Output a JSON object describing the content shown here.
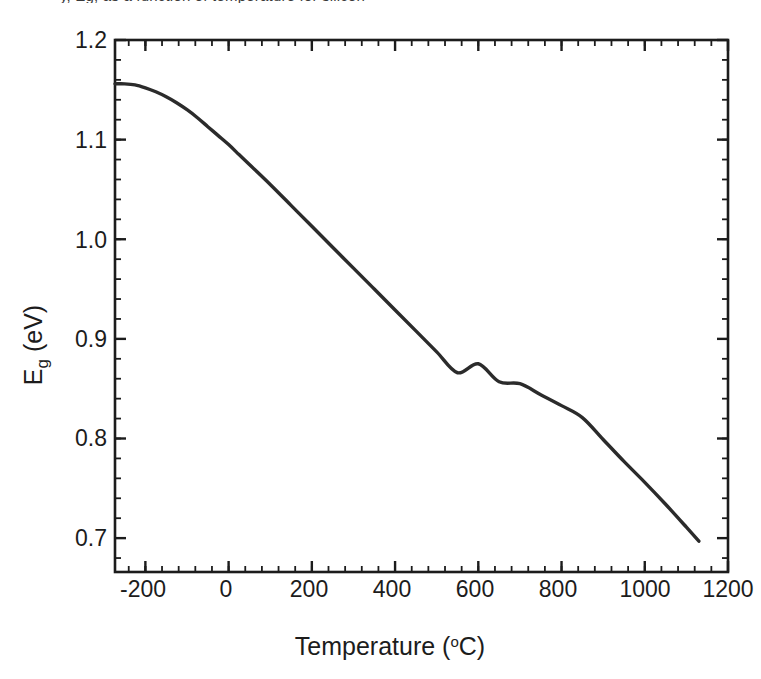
{
  "figure": {
    "caption_fragment": "y, Eg, as a function of temperature for silicon",
    "background_color": "#ffffff",
    "frame_color": "#1c1c1c",
    "curve_color": "#2b2b2b"
  },
  "chart_data": {
    "type": "line",
    "title": "",
    "xlabel": "Temperature (°C)",
    "xlabel_text": "Temperature (",
    "xlabel_unit_sup": "o",
    "xlabel_unit_rest": "C)",
    "ylabel": "Eg (eV)",
    "ylabel_main": "E",
    "ylabel_sub": "g",
    "ylabel_rest": " (eV)",
    "xlim": [
      -273,
      1200
    ],
    "ylim": [
      0.666,
      1.2
    ],
    "xticks": [
      -200,
      0,
      200,
      400,
      600,
      800,
      1000,
      1200
    ],
    "xtick_labels": [
      "-200",
      "0",
      "200",
      "400",
      "600",
      "800",
      "1000",
      "1200"
    ],
    "yticks": [
      0.7,
      0.8,
      0.9,
      1.0,
      1.1,
      1.2
    ],
    "ytick_labels": [
      "0.7",
      "0.8",
      "0.9",
      "1.0",
      "1.1",
      "1.2"
    ],
    "x_minor_per_major": 4,
    "y_minor_per_major": 4,
    "grid": false,
    "legend": null,
    "ticks_direction": "in",
    "series": [
      {
        "name": "Silicon bandgap (Varshni)",
        "x": [
          -273,
          -250,
          -225,
          -200,
          -175,
          -150,
          -125,
          -100,
          -75,
          -50,
          -25,
          0,
          25,
          50,
          100,
          150,
          200,
          250,
          300,
          350,
          400,
          450,
          500,
          550,
          600,
          650,
          700,
          750,
          800,
          850,
          900,
          950,
          1000,
          1050,
          1100,
          1130
        ],
        "y": [
          1.156,
          1.156,
          1.155,
          1.152,
          1.148,
          1.143,
          1.137,
          1.13,
          1.122,
          1.113,
          1.104,
          1.095,
          1.085,
          1.075,
          1.055,
          1.034,
          1.013,
          0.992,
          0.971,
          0.95,
          0.929,
          0.908,
          0.887,
          0.866,
          0.875,
          0.857,
          0.855,
          0.844,
          0.833,
          0.821,
          0.799,
          0.777,
          0.756,
          0.734,
          0.711,
          0.697
        ]
      }
    ],
    "annotations": []
  }
}
